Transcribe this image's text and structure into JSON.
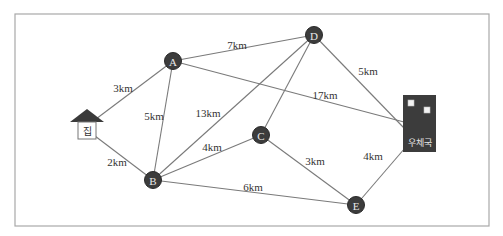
{
  "diagram": {
    "type": "weighted-graph-map",
    "places": {
      "home": {
        "label": "집",
        "x": 87,
        "y": 128
      },
      "post_office": {
        "label": "우체국",
        "x": 420,
        "y": 124
      }
    },
    "nodes": [
      {
        "id": "A",
        "label": "A",
        "x": 173,
        "y": 61
      },
      {
        "id": "B",
        "label": "B",
        "x": 153,
        "y": 180
      },
      {
        "id": "C",
        "label": "C",
        "x": 261,
        "y": 135
      },
      {
        "id": "D",
        "label": "D",
        "x": 314,
        "y": 35
      },
      {
        "id": "E",
        "label": "E",
        "x": 356,
        "y": 205
      }
    ],
    "edges": [
      {
        "from": "home",
        "to": "A",
        "label": "3km",
        "lx": 123,
        "ly": 88
      },
      {
        "from": "home",
        "to": "B",
        "label": "2km",
        "lx": 117,
        "ly": 162
      },
      {
        "from": "A",
        "to": "D",
        "label": "7km",
        "lx": 237,
        "ly": 45
      },
      {
        "from": "A",
        "to": "B",
        "label": "5km",
        "lx": 154,
        "ly": 116
      },
      {
        "from": "A",
        "to": "post_office",
        "label": "17km",
        "lx": 325,
        "ly": 95
      },
      {
        "from": "D",
        "to": "B",
        "label": "13km",
        "lx": 208,
        "ly": 113
      },
      {
        "from": "D",
        "to": "C",
        "label": "",
        "lx": 0,
        "ly": 0
      },
      {
        "from": "D",
        "to": "post_office",
        "label": "5km",
        "lx": 368,
        "ly": 71
      },
      {
        "from": "B",
        "to": "C",
        "label": "4km",
        "lx": 212,
        "ly": 147
      },
      {
        "from": "B",
        "to": "E",
        "label": "6km",
        "lx": 253,
        "ly": 187
      },
      {
        "from": "C",
        "to": "E",
        "label": "3km",
        "lx": 315,
        "ly": 161
      },
      {
        "from": "E",
        "to": "post_office",
        "label": "4km",
        "lx": 373,
        "ly": 156
      }
    ]
  }
}
